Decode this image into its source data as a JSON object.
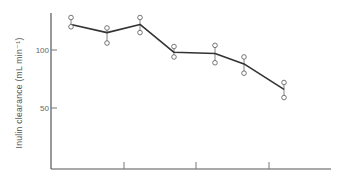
{
  "chart_data": {
    "type": "line",
    "title": "",
    "xlabel": "",
    "ylabel": "Inulin clearance (mL min⁻¹)",
    "ylim": [
      0,
      135
    ],
    "yticks": [
      50,
      100
    ],
    "ytick_labels": [
      "50",
      "100"
    ],
    "xticks_count": 3,
    "xtick_labels": [],
    "grid": false,
    "legend": null,
    "series": [
      {
        "name": "Inulin clearance",
        "x": [
          1,
          2,
          3,
          4,
          5,
          6,
          7
        ],
        "values": [
          122,
          115,
          122,
          98,
          97,
          88,
          66
        ],
        "upper": [
          128,
          119,
          128,
          103,
          104,
          94,
          72
        ],
        "lower": [
          120,
          106,
          115,
          94,
          89,
          80,
          59
        ]
      }
    ]
  },
  "axis": {
    "y_label": "Inulin clearance (mL min⁻¹)",
    "tick_100": "100",
    "tick_50": "50"
  },
  "colors": {
    "line": "#333333",
    "axis": "#555555",
    "marker": "#666666"
  }
}
